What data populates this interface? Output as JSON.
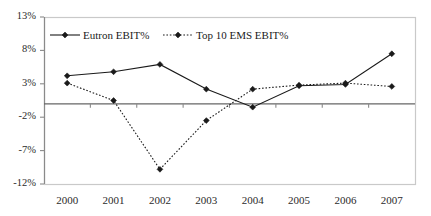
{
  "chart_data": {
    "type": "line",
    "title": "",
    "subtitle": "",
    "xlabel": "",
    "ylabel": "",
    "categories": [
      "2000",
      "2001",
      "2002",
      "2003",
      "2004",
      "2005",
      "2006",
      "2007"
    ],
    "x": [
      2000,
      2001,
      2002,
      2003,
      2004,
      2005,
      2006,
      2007
    ],
    "series": [
      {
        "name": "Eutron EBIT%",
        "marker": "diamond",
        "line_style": "solid",
        "color": "#1a1a1a",
        "values": [
          4.2,
          4.8,
          5.9,
          2.2,
          -0.5,
          2.7,
          2.9,
          7.5
        ]
      },
      {
        "name": "Top 10 EMS EBIT%",
        "marker": "diamond",
        "line_style": "dotted",
        "color": "#1a1a1a",
        "values": [
          3.1,
          0.5,
          -9.8,
          -2.5,
          2.2,
          2.8,
          3.1,
          2.6
        ]
      }
    ],
    "ylim": [
      -12,
      13
    ],
    "yticks": [
      13,
      8,
      3,
      -2,
      -7,
      -12
    ],
    "ytick_labels": [
      "13%",
      "8%",
      "3%",
      "-2%",
      "-7%",
      "-12%"
    ],
    "xtick_labels": [
      "2000",
      "2001",
      "2002",
      "2003",
      "2004",
      "2005",
      "2006",
      "2007"
    ],
    "grid": false,
    "zero_line": true,
    "legend_position": "top-inside",
    "legend": [
      "Eutron EBIT%",
      "Top 10 EMS EBIT%"
    ]
  },
  "legend": {
    "entries": [
      {
        "label": "Eutron EBIT%"
      },
      {
        "label": "Top 10 EMS EBIT%"
      }
    ]
  },
  "axes": {
    "y_labels": [
      "13%",
      "8%",
      "3%",
      "-2%",
      "-7%",
      "-12%"
    ],
    "x_labels": [
      "2000",
      "2001",
      "2002",
      "2003",
      "2004",
      "2005",
      "2006",
      "2007"
    ]
  },
  "colors": {
    "frame": "#c9c9c9",
    "zero_line": "#666666",
    "axis": "#8a8a8a",
    "series": "#1a1a1a",
    "text": "#2b2b2b",
    "background": "#ffffff"
  }
}
